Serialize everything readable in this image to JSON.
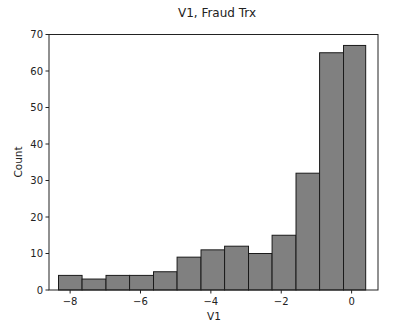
{
  "chart_data": {
    "type": "bar",
    "title": "V1, Fraud Trx",
    "xlabel": "V1",
    "ylabel": "Count",
    "xlim": [
      -8.6,
      0.75
    ],
    "ylim": [
      0,
      70
    ],
    "x_ticks": [
      -8,
      -6,
      -4,
      -2,
      0
    ],
    "x_tick_labels": [
      "−8",
      "−6",
      "−4",
      "−2",
      "0"
    ],
    "y_ticks": [
      0,
      10,
      20,
      30,
      40,
      50,
      60,
      70
    ],
    "y_tick_labels": [
      "0",
      "10",
      "20",
      "30",
      "40",
      "50",
      "60",
      "70"
    ],
    "grid": false,
    "legend": null,
    "bar_color": "#808080",
    "edge_color": "#1a1a1a",
    "bin_edges": [
      -8.33,
      -7.65,
      -6.97,
      -6.29,
      -5.61,
      -4.93,
      -4.25,
      -3.57,
      -2.89,
      -2.21,
      -1.53,
      -0.85,
      -0.17,
      0.4
    ],
    "bins": [
      {
        "x0": -8.33,
        "x1": -7.66,
        "count": 4
      },
      {
        "x0": -7.66,
        "x1": -6.98,
        "count": 3
      },
      {
        "x0": -6.98,
        "x1": -6.31,
        "count": 4
      },
      {
        "x0": -6.31,
        "x1": -5.63,
        "count": 4
      },
      {
        "x0": -5.63,
        "x1": -4.96,
        "count": 5
      },
      {
        "x0": -4.96,
        "x1": -4.28,
        "count": 9
      },
      {
        "x0": -4.28,
        "x1": -3.61,
        "count": 11
      },
      {
        "x0": -3.61,
        "x1": -2.93,
        "count": 12
      },
      {
        "x0": -2.93,
        "x1": -2.26,
        "count": 10
      },
      {
        "x0": -2.26,
        "x1": -1.58,
        "count": 15
      },
      {
        "x0": -1.58,
        "x1": -0.91,
        "count": 32
      },
      {
        "x0": -0.91,
        "x1": -0.23,
        "count": 65
      },
      {
        "x0": -0.23,
        "x1": 0.4,
        "count": 67
      }
    ]
  }
}
